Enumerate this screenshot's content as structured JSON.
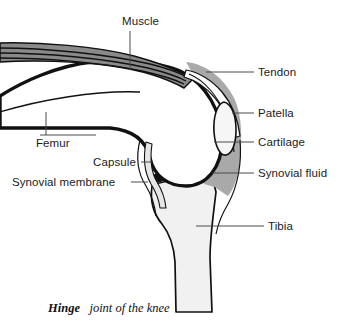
{
  "figure": {
    "title": "Hinge joint of the knee",
    "caption_bold": "Hinge",
    "caption_rest": "joint of the knee"
  },
  "labels": [
    {
      "id": "muscle",
      "text": "Muscle",
      "side": "top",
      "text_x": 122,
      "text_y": 25,
      "anchor": "start"
    },
    {
      "id": "tendon",
      "text": "Tendon",
      "side": "right",
      "text_x": 258,
      "text_y": 76,
      "anchor": "start"
    },
    {
      "id": "patella",
      "text": "Patella",
      "side": "right",
      "text_x": 258,
      "text_y": 117,
      "anchor": "start"
    },
    {
      "id": "cartilage",
      "text": "Cartilage",
      "side": "right",
      "text_x": 258,
      "text_y": 146,
      "anchor": "start"
    },
    {
      "id": "synovial-fluid",
      "text": "Synovial fluid",
      "side": "right",
      "text_x": 258,
      "text_y": 177,
      "anchor": "start"
    },
    {
      "id": "tibia",
      "text": "Tibia",
      "side": "right",
      "text_x": 268,
      "text_y": 230,
      "anchor": "start"
    },
    {
      "id": "femur",
      "text": "Femur",
      "side": "left",
      "text_x": 36,
      "text_y": 147,
      "anchor": "start"
    },
    {
      "id": "capsule",
      "text": "Capsule",
      "side": "left",
      "text_x": 93,
      "text_y": 166,
      "anchor": "start"
    },
    {
      "id": "synovial-membrane",
      "text": "Synovial membrane",
      "side": "left",
      "text_x": 12,
      "text_y": 186,
      "anchor": "start"
    }
  ],
  "colors": {
    "background": "#ffffff",
    "muscle": "#8a8a8a",
    "cartilage_gray": "#a9a9a9",
    "synovial_fluid": "#9c9c9c",
    "bone_light": "#f1f1f1",
    "tendon_light": "#fbfbfb",
    "outline_dark": "#111111",
    "leader_line": "#4a4a4a",
    "text": "#1a1a1a"
  }
}
